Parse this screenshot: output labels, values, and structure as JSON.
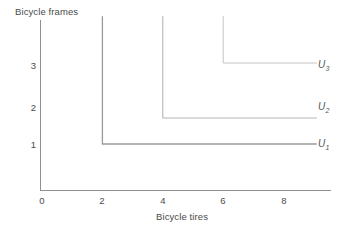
{
  "chart_data": {
    "type": "line",
    "title": "",
    "subtitle": "",
    "xlabel": "Bicycle tires",
    "ylabel": "Bicycle frames",
    "xticks": [
      0,
      2,
      4,
      6,
      8
    ],
    "xtick_labels": [
      "0",
      "2",
      "4",
      "6",
      "8"
    ],
    "yticks": [
      1,
      2,
      3
    ],
    "ytick_labels": [
      "1",
      "2",
      "3"
    ],
    "xlim": [
      0,
      9.6
    ],
    "ylim": [
      0,
      3.85
    ],
    "grid": false,
    "legend_position": "right-inline",
    "annotations": [
      "U1",
      "U2",
      "U3"
    ],
    "series": [
      {
        "name": "U1",
        "label": "U",
        "subscript": "1",
        "kink": {
          "x": 2,
          "y": 1
        },
        "x": [
          2,
          2,
          9.1
        ],
        "y": [
          3.85,
          1,
          1
        ],
        "color": "#9a9a9a",
        "width": 1.3,
        "label_pos": {
          "x": 6.9,
          "y": 1
        }
      },
      {
        "name": "U2",
        "label": "U",
        "subscript": "2",
        "kink": {
          "x": 4,
          "y": 2
        },
        "x": [
          4,
          4,
          9.1
        ],
        "y": [
          3.85,
          2,
          2
        ],
        "color": "#b4b4b4",
        "width": 1.1,
        "label_pos": {
          "x": 6.9,
          "y": 2
        }
      },
      {
        "name": "U3",
        "label": "U",
        "subscript": "3",
        "kink": {
          "x": 6,
          "y": 3
        },
        "x": [
          6,
          6,
          9.1
        ],
        "y": [
          3.85,
          3,
          3
        ],
        "color": "#c4c4c4",
        "width": 1.0,
        "label_pos": {
          "x": 6.9,
          "y": 3
        }
      }
    ],
    "axis_color": "#8f8f8f",
    "text_color": "#4a4a4a"
  },
  "axes": {
    "y_title": "Bicycle frames",
    "x_title": "Bicycle tires"
  },
  "ticks": {
    "x": [
      {
        "label": "0"
      },
      {
        "label": "2"
      },
      {
        "label": "4"
      },
      {
        "label": "6"
      },
      {
        "label": "8"
      }
    ],
    "y": [
      {
        "label": "1"
      },
      {
        "label": "2"
      },
      {
        "label": "3"
      }
    ]
  },
  "curve_labels": [
    {
      "base": "U",
      "sub": "1"
    },
    {
      "base": "U",
      "sub": "2"
    },
    {
      "base": "U",
      "sub": "3"
    }
  ]
}
